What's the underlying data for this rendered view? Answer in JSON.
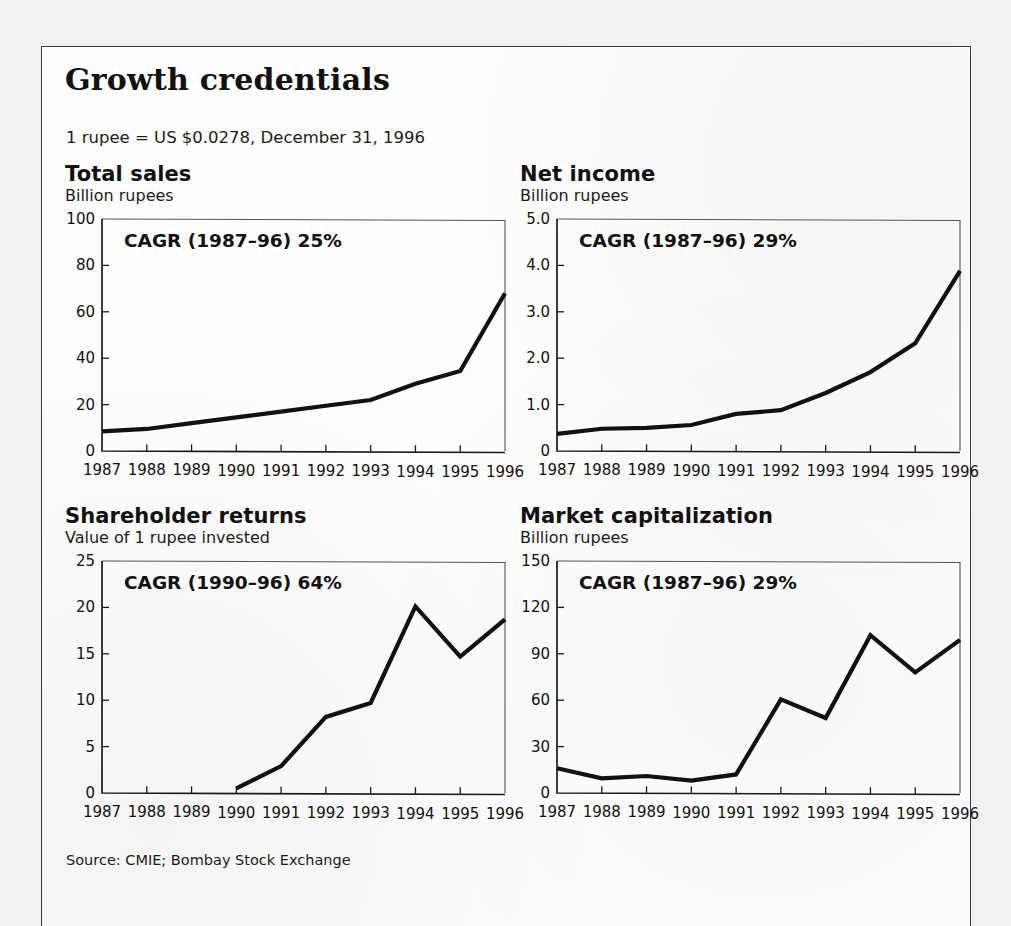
{
  "document": {
    "title": "Growth credentials",
    "fx_note": "1 rupee = US $0.0278, December 31, 1996",
    "source": "Source: CMIE; Bombay Stock Exchange",
    "border_color": "#3a3a3a",
    "line_color": "#111111",
    "page_background": "#fdfdfc"
  },
  "panels": [
    {
      "title": "Total sales",
      "subtitle": "Billion rupees",
      "annotation": "CAGR (1987–96) 25%"
    },
    {
      "title": "Net income",
      "subtitle": "Billion rupees",
      "annotation": "CAGR (1987–96) 29%"
    },
    {
      "title": "Shareholder returns",
      "subtitle": "Value of 1 rupee invested",
      "annotation": "CAGR (1990–96) 64%"
    },
    {
      "title": "Market capitalization",
      "subtitle": "Billion rupees",
      "annotation": "CAGR (1987–96) 29%"
    }
  ],
  "chart_data": [
    {
      "type": "line",
      "title": "Total sales",
      "subtitle": "Billion rupees",
      "annotation": "CAGR (1987–96) 25%",
      "xlabel": "",
      "ylabel": "Billion rupees",
      "x": [
        1987,
        1988,
        1989,
        1990,
        1991,
        1992,
        1993,
        1994,
        1995,
        1996
      ],
      "categories": [
        "1987",
        "1988",
        "1989",
        "1990",
        "1991",
        "1992",
        "1993",
        "1994",
        "1995",
        "1996"
      ],
      "values": [
        8.5,
        9.5,
        12.0,
        14.5,
        17.0,
        19.5,
        22.0,
        29.0,
        34.5,
        68.0
      ],
      "ylim": [
        0,
        100
      ],
      "yticks": [
        0,
        20,
        40,
        60,
        80,
        100
      ],
      "ytick_labels": [
        "0",
        "20",
        "40",
        "60",
        "80",
        "100"
      ],
      "grid": false,
      "legend": false
    },
    {
      "type": "line",
      "title": "Net income",
      "subtitle": "Billion rupees",
      "annotation": "CAGR (1987–96) 29%",
      "xlabel": "",
      "ylabel": "Billion rupees",
      "x": [
        1987,
        1988,
        1989,
        1990,
        1991,
        1992,
        1993,
        1994,
        1995,
        1996
      ],
      "categories": [
        "1987",
        "1988",
        "1989",
        "1990",
        "1991",
        "1992",
        "1993",
        "1994",
        "1995",
        "1996"
      ],
      "values": [
        0.37,
        0.48,
        0.5,
        0.56,
        0.8,
        0.88,
        1.25,
        1.7,
        2.32,
        3.88
      ],
      "ylim": [
        0,
        5.0
      ],
      "yticks": [
        0,
        1.0,
        2.0,
        3.0,
        4.0,
        5.0
      ],
      "ytick_labels": [
        "0",
        "1.0",
        "2.0",
        "3.0",
        "4.0",
        "5.0"
      ],
      "grid": false,
      "legend": false
    },
    {
      "type": "line",
      "title": "Shareholder returns",
      "subtitle": "Value of 1 rupee invested",
      "annotation": "CAGR (1990–96) 64%",
      "xlabel": "",
      "ylabel": "Value of 1 rupee invested",
      "x": [
        1990,
        1991,
        1992,
        1993,
        1994,
        1995,
        1996
      ],
      "categories": [
        "1987",
        "1988",
        "1989",
        "1990",
        "1991",
        "1992",
        "1993",
        "1994",
        "1995",
        "1996"
      ],
      "values": [
        0.5,
        2.9,
        8.2,
        9.7,
        20.1,
        14.7,
        18.7
      ],
      "ylim": [
        0,
        25
      ],
      "yticks": [
        0,
        5,
        10,
        15,
        20,
        25
      ],
      "ytick_labels": [
        "0",
        "5",
        "10",
        "15",
        "20",
        "25"
      ],
      "grid": false,
      "legend": false
    },
    {
      "type": "line",
      "title": "Market capitalization",
      "subtitle": "Billion rupees",
      "annotation": "CAGR (1987–96) 29%",
      "xlabel": "",
      "ylabel": "Billion rupees",
      "x": [
        1987,
        1988,
        1989,
        1990,
        1991,
        1992,
        1993,
        1994,
        1995,
        1996
      ],
      "categories": [
        "1987",
        "1988",
        "1989",
        "1990",
        "1991",
        "1992",
        "1993",
        "1994",
        "1995",
        "1996"
      ],
      "values": [
        16.0,
        9.5,
        11.0,
        8.0,
        12.0,
        60.5,
        48.5,
        102.0,
        78.0,
        99.0
      ],
      "ylim": [
        0,
        150
      ],
      "yticks": [
        0,
        30,
        60,
        90,
        120,
        150
      ],
      "ytick_labels": [
        "0",
        "30",
        "60",
        "90",
        "120",
        "150"
      ],
      "grid": false,
      "legend": false
    }
  ]
}
